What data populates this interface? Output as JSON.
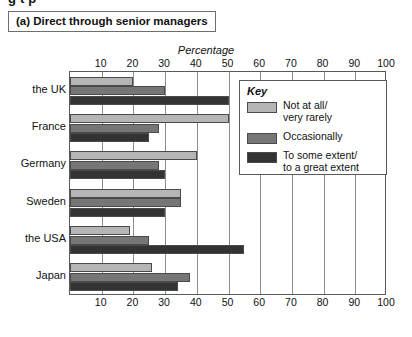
{
  "clipped_heading": "g             t      p             ",
  "panel_title": "(a) Direct through senior managers",
  "axis_title": "Percentage",
  "legend": {
    "title": "Key",
    "items": [
      {
        "label": "Not at all/\nvery rarely",
        "color": "#b5b5b5"
      },
      {
        "label": "Occasionally",
        "color": "#767676"
      },
      {
        "label": "To some extent/\nto a great extent",
        "color": "#333333"
      }
    ]
  },
  "chart_data": {
    "type": "bar",
    "orientation": "horizontal",
    "title": "(a) Direct through senior managers",
    "xlabel": "Percentage",
    "ylabel": "",
    "xlim": [
      0,
      100
    ],
    "xticks": [
      0,
      10,
      20,
      30,
      40,
      50,
      60,
      70,
      80,
      90,
      100
    ],
    "xtick_labels": [
      "",
      "10",
      "20",
      "30",
      "40",
      "50",
      "60",
      "70",
      "80",
      "90",
      "100"
    ],
    "grid": true,
    "legend_position": "inside-upper-right",
    "categories": [
      "the UK",
      "France",
      "Germany",
      "Sweden",
      "the USA",
      "Japan"
    ],
    "series": [
      {
        "name": "Not at all/very rarely",
        "color": "#b5b5b5",
        "values": [
          20,
          50,
          40,
          35,
          19,
          26
        ]
      },
      {
        "name": "Occasionally",
        "color": "#767676",
        "values": [
          30,
          28,
          28,
          35,
          25,
          38
        ]
      },
      {
        "name": "To some extent/to a great extent",
        "color": "#333333",
        "values": [
          50,
          25,
          30,
          30,
          55,
          34
        ]
      }
    ]
  }
}
